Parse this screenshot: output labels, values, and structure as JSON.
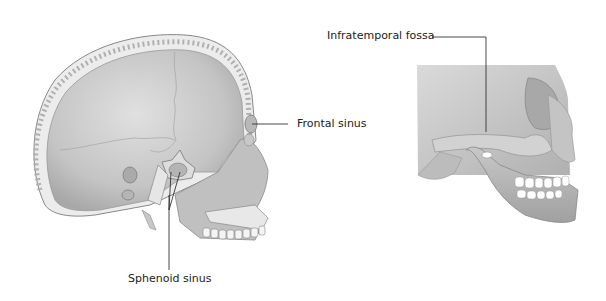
{
  "figures": [
    {
      "name": "lateral-skull-sagittal-section",
      "labels": {
        "frontal_sinus": "Frontal sinus",
        "sphenoid_sinus": "Sphenoid sinus"
      }
    },
    {
      "name": "lateral-skull-face",
      "labels": {
        "infratemporal_fossa": "Infratemporal fossa"
      }
    }
  ],
  "colors": {
    "bone": "#c8c8c8",
    "bone_light": "#e2e2e2",
    "bone_dark": "#9a9a9a",
    "line": "#333333",
    "teeth": "#ffffff"
  }
}
